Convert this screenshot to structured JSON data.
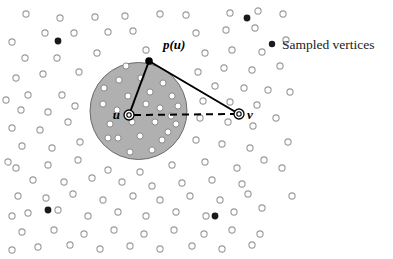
{
  "figure": {
    "title": "",
    "background_color": "#ffffff",
    "width": 393,
    "height": 259
  },
  "legend": {
    "marker_name": "filled-dot-marker",
    "marker_color": "#1a1a1a",
    "marker_cx": 272,
    "marker_cy": 44,
    "marker_r": 3.1,
    "label": "Sampled vertices",
    "label_x": 282,
    "label_y": 49
  },
  "labels": {
    "p_of_u": "p(u)",
    "p_of_u_x": 163,
    "p_of_u_y": 49,
    "u": "u",
    "u_x": 120,
    "u_y": 118,
    "v": "v",
    "v_x": 249,
    "v_y": 119
  },
  "disk": {
    "name": "shaded-disk",
    "cx": 138.5,
    "cy": 111,
    "r": 48.5,
    "fill": "#b0b0b0",
    "stroke": "#6b6b6b",
    "stroke_width": 1
  },
  "vertices": {
    "u_node": {
      "cx": 129,
      "cy": 115,
      "r_outer": 5.0,
      "r_inner": 2.2
    },
    "v_node": {
      "cx": 239,
      "cy": 114,
      "r_outer": 5.0,
      "r_inner": 2.2
    },
    "pu_node": {
      "cx": 149,
      "cy": 61,
      "r": 3.6
    }
  },
  "edges": {
    "u_to_pu": {
      "x1": 129,
      "y1": 115,
      "x2": 149,
      "y2": 61,
      "style": "solid",
      "width": 2.0
    },
    "pu_to_v": {
      "x1": 149,
      "y1": 61,
      "x2": 239,
      "y2": 114,
      "style": "solid",
      "width": 2.0
    },
    "u_to_v": {
      "x1": 134,
      "y1": 115,
      "x2": 234,
      "y2": 114,
      "style": "dashed",
      "width": 2.0,
      "dash": "7 5"
    }
  },
  "markers": {
    "open_circle_color": "#9a9a9a",
    "open_circle_fill": "#ffffff",
    "open_circle_r": 3.1,
    "open_circle_in_disk_fill": "#ffffff",
    "open_circle_in_disk_stroke": "#8a8a8a",
    "filled_circle_color": "#1a1a1a",
    "filled_circle_r": 3.4
  },
  "chart_data": {
    "type": "scatter",
    "title": "",
    "xlabel": "",
    "ylabel": "",
    "xlim": [
      0,
      393
    ],
    "ylim": [
      0,
      259
    ],
    "grid": false,
    "legend_position": "top-right",
    "series": [
      {
        "name": "Unsampled vertices (outside disk)",
        "marker": "open-circle",
        "points": [
          [
            26,
            14
          ],
          [
            60,
            18
          ],
          [
            95,
            17
          ],
          [
            125,
            16
          ],
          [
            160,
            14
          ],
          [
            186,
            15
          ],
          [
            230,
            13
          ],
          [
            258,
            11
          ],
          [
            45,
            33
          ],
          [
            74,
            33
          ],
          [
            108,
            32
          ],
          [
            133,
            31
          ],
          [
            196,
            33
          ],
          [
            226,
            30
          ],
          [
            255,
            28
          ],
          [
            25,
            58
          ],
          [
            57,
            58
          ],
          [
            97,
            53
          ],
          [
            146,
            50
          ],
          [
            205,
            53
          ],
          [
            232,
            50
          ],
          [
            262,
            52
          ],
          [
            16,
            78
          ],
          [
            43,
            74
          ],
          [
            79,
            72
          ],
          [
            120,
            65
          ],
          [
            198,
            72
          ],
          [
            224,
            68
          ],
          [
            252,
            70
          ],
          [
            28,
            95
          ],
          [
            62,
            95
          ],
          [
            96,
            88
          ],
          [
            215,
            86
          ],
          [
            244,
            88
          ],
          [
            268,
            90
          ],
          [
            21,
            110
          ],
          [
            48,
            112
          ],
          [
            75,
            106
          ],
          [
            203,
            101
          ],
          [
            230,
            102
          ],
          [
            257,
            105
          ],
          [
            12,
            128
          ],
          [
            40,
            130
          ],
          [
            68,
            122
          ],
          [
            200,
            118
          ],
          [
            228,
            122
          ],
          [
            253,
            126
          ],
          [
            22,
            146
          ],
          [
            52,
            148
          ],
          [
            80,
            142
          ],
          [
            196,
            140
          ],
          [
            222,
            144
          ],
          [
            250,
            148
          ],
          [
            16,
            168
          ],
          [
            48,
            165
          ],
          [
            78,
            160
          ],
          [
            108,
            170
          ],
          [
            140,
            172
          ],
          [
            172,
            165
          ],
          [
            205,
            162
          ],
          [
            237,
            168
          ],
          [
            264,
            160
          ],
          [
            33,
            180
          ],
          [
            64,
            182
          ],
          [
            92,
            178
          ],
          [
            122,
            182
          ],
          [
            152,
            186
          ],
          [
            182,
            183
          ],
          [
            212,
            180
          ],
          [
            242,
            184
          ],
          [
            18,
            196
          ],
          [
            46,
            198
          ],
          [
            73,
            194
          ],
          [
            103,
            200
          ],
          [
            133,
            196
          ],
          [
            160,
            200
          ],
          [
            190,
            196
          ],
          [
            220,
            200
          ],
          [
            248,
            194
          ],
          [
            28,
            213
          ],
          [
            58,
            210
          ],
          [
            88,
            216
          ],
          [
            118,
            212
          ],
          [
            146,
            216
          ],
          [
            176,
            212
          ],
          [
            206,
            216
          ],
          [
            234,
            212
          ],
          [
            262,
            208
          ],
          [
            22,
            232
          ],
          [
            54,
            230
          ],
          [
            84,
            234
          ],
          [
            114,
            230
          ],
          [
            144,
            234
          ],
          [
            174,
            230
          ],
          [
            204,
            234
          ],
          [
            232,
            230
          ],
          [
            260,
            234
          ],
          [
            38,
            247
          ],
          [
            70,
            245
          ],
          [
            100,
            249
          ],
          [
            130,
            246
          ],
          [
            160,
            249
          ],
          [
            192,
            246
          ],
          [
            222,
            249
          ],
          [
            252,
            245
          ],
          [
            283,
            14
          ],
          [
            286,
            40
          ],
          [
            280,
            66
          ],
          [
            290,
            92
          ],
          [
            276,
            118
          ],
          [
            288,
            142
          ],
          [
            282,
            168
          ],
          [
            292,
            196
          ],
          [
            12,
            42
          ],
          [
            12,
            216
          ],
          [
            12,
            250
          ],
          [
            8,
            162
          ],
          [
            6,
            100
          ]
        ]
      },
      {
        "name": "Unsampled vertices (inside disk, white fill)",
        "marker": "open-circle-light",
        "points": [
          [
            119,
            80
          ],
          [
            141,
            78
          ],
          [
            163,
            83
          ],
          [
            128,
            96
          ],
          [
            150,
            92
          ],
          [
            172,
            96
          ],
          [
            103,
            104
          ],
          [
            117,
            110
          ],
          [
            160,
            108
          ],
          [
            178,
            106
          ],
          [
            110,
            124
          ],
          [
            132,
            122
          ],
          [
            155,
            122
          ],
          [
            176,
            124
          ],
          [
            118,
            138
          ],
          [
            140,
            136
          ],
          [
            162,
            140
          ],
          [
            130,
            152
          ],
          [
            152,
            150
          ],
          [
            104,
            88
          ],
          [
            171,
            116
          ],
          [
            108,
            138
          ],
          [
            126,
            66
          ],
          [
            146,
            104
          ],
          [
            168,
            132
          ]
        ]
      },
      {
        "name": "Sampled vertices",
        "marker": "filled-dot",
        "points": [
          [
            58,
            41
          ],
          [
            247,
            18
          ],
          [
            48,
            210
          ],
          [
            215,
            216
          ],
          [
            272,
            44
          ]
        ]
      }
    ],
    "annotations": [
      {
        "text": "p(u)",
        "x": 163,
        "y": 49
      },
      {
        "text": "u",
        "x": 120,
        "y": 118
      },
      {
        "text": "v",
        "x": 249,
        "y": 119
      },
      {
        "text": "Sampled vertices",
        "x": 282,
        "y": 49
      }
    ]
  }
}
